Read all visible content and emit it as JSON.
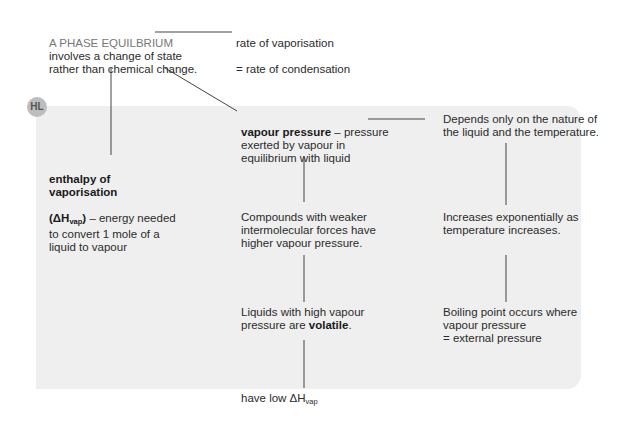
{
  "badge": {
    "label": "HL"
  },
  "nodes": {
    "phase_equilibrium": {
      "heading": "A PHASE EQUILBRIUM",
      "body": "involves a change of state\nrather than chemical change."
    },
    "rates": {
      "line1": "rate of vaporisation",
      "line2": "= rate of condensation"
    },
    "enthalpy": {
      "term": "enthalpy of vaporisation",
      "symbol_open": "(ΔH",
      "symbol_sub": "vap",
      "symbol_close": ")",
      "definition": " – energy needed",
      "rest": "to convert 1 mole of a\nliquid to vapour"
    },
    "vapour_pressure": {
      "term": "vapour pressure",
      "definition": " – pressure",
      "rest": "exerted by vapour in\nequilibrium with liquid"
    },
    "depends": {
      "text": "Depends only on the nature of\nthe liquid and the temperature."
    },
    "weaker_forces": {
      "text": "Compounds with weaker\nintermolecular forces have\nhigher vapour pressure."
    },
    "exponential": {
      "text": "Increases exponentially as\ntemperature increases."
    },
    "volatile": {
      "prefix": "Liquids with high vapour\npressure are ",
      "term": "volatile",
      "suffix": "."
    },
    "boiling_point": {
      "text": "Boiling point occurs where\nvapour pressure\n= external pressure"
    },
    "low_enthalpy": {
      "prefix": "have low ΔH",
      "sub": "vap"
    }
  },
  "colors": {
    "panel": "#efefef",
    "badge": "#bdbdbd",
    "line": "#444444",
    "text": "#2b2b2b"
  }
}
